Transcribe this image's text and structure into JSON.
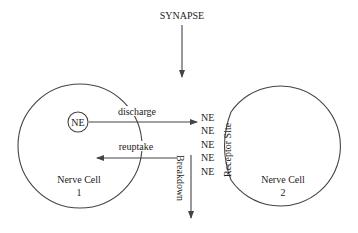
{
  "title": "SYNAPSE",
  "cells": [
    {
      "label": "Nerve Cell",
      "number": "1"
    },
    {
      "label": "Nerve Cell",
      "number": "2"
    }
  ],
  "vesicle_label": "NE",
  "processes": {
    "discharge": "discharge",
    "reuptake": "reuptake",
    "breakdown": "Breakdown",
    "receptor_site": "Receptor Site"
  },
  "cleft_molecules": [
    "NE",
    "NE",
    "NE",
    "NE",
    "NE"
  ],
  "colors": {
    "stroke": "#444444",
    "text": "#222222",
    "background": "#ffffff"
  }
}
